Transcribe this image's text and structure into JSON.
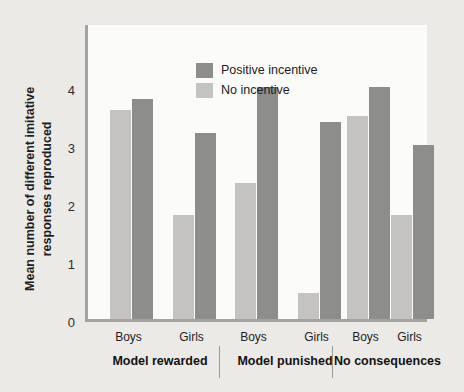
{
  "chart_data": {
    "type": "bar",
    "title": "",
    "xlabel": "",
    "ylabel": "Mean number of different imitative responses reproduced",
    "ylim": [
      0,
      4.7
    ],
    "yticks": [
      0,
      1,
      2,
      3,
      4
    ],
    "ytick_labels": [
      "0",
      "1",
      "2",
      "3",
      "4"
    ],
    "grid": false,
    "legend_position": "top-left",
    "groups": [
      {
        "name": "Model rewarded",
        "categories": [
          "Boys",
          "Girls"
        ]
      },
      {
        "name": "Model punished",
        "categories": [
          "Boys",
          "Girls"
        ]
      },
      {
        "name": "No consequences",
        "categories": [
          "Boys",
          "Girls"
        ]
      }
    ],
    "categories": [
      "Model rewarded Boys",
      "Model rewarded Girls",
      "Model punished Boys",
      "Model punished Girls",
      "No consequences Boys",
      "No consequences Girls"
    ],
    "series": [
      {
        "name": "No incentive",
        "color": "#c4c3c1",
        "values": [
          3.6,
          1.8,
          2.35,
          0.45,
          3.5,
          1.8
        ]
      },
      {
        "name": "Positive incentive",
        "color": "#8d8d8c",
        "values": [
          3.8,
          3.2,
          4.0,
          3.4,
          4.0,
          3.0
        ]
      }
    ]
  },
  "legend": {
    "items": [
      {
        "label": "Positive incentive",
        "swatch": "dark"
      },
      {
        "label": "No incentive",
        "swatch": "light"
      }
    ]
  },
  "axis": {
    "y_title": "Mean number of different imitative responses reproduced"
  },
  "colors": {
    "positive_incentive": "#8d8d8c",
    "no_incentive": "#c4c3c1",
    "panel_background": "#fbfbfa",
    "figure_background": "#eceae7",
    "axis_line": "#a5a3a0"
  }
}
